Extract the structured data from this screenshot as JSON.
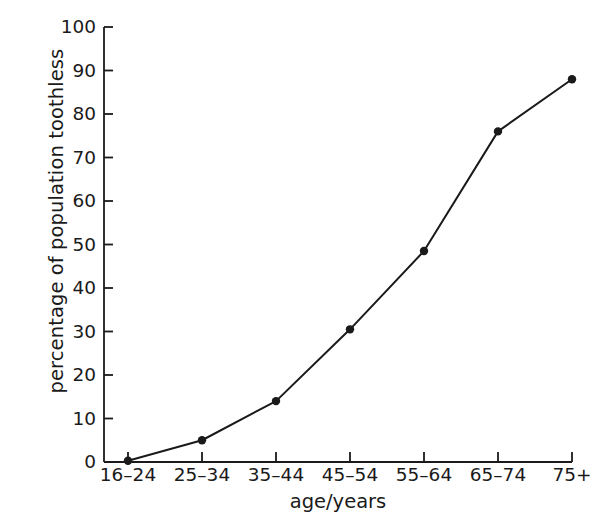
{
  "chart_data": {
    "type": "line",
    "title": "",
    "subtitle": "",
    "xlabel": "age/years",
    "ylabel": "percentage of population toothless",
    "categories": [
      "16–24",
      "25–34",
      "35–44",
      "45–54",
      "55–64",
      "65–74",
      "75+"
    ],
    "values": [
      0.3,
      5,
      14,
      30.5,
      48.5,
      76,
      88
    ],
    "series": [
      {
        "name": "percentage of population toothless",
        "values": [
          0.3,
          5,
          14,
          30.5,
          48.5,
          76,
          88
        ]
      }
    ],
    "ylim": [
      0,
      100
    ],
    "yticks": [
      0,
      10,
      20,
      30,
      40,
      50,
      60,
      70,
      80,
      90,
      100
    ],
    "ytick_labels": [
      "0",
      "10",
      "20",
      "30",
      "40",
      "50",
      "60",
      "70",
      "80",
      "90",
      "100"
    ],
    "xtick_labels": [
      "16–24",
      "25–34",
      "35–44",
      "45–54",
      "55–64",
      "65–74",
      "75+"
    ],
    "grid": false,
    "legend": false,
    "legend_position": "none",
    "marker": "filled-circle",
    "line_color": "#1a1a1a",
    "marker_color": "#1a1a1a",
    "background_color": "#ffffff",
    "annotations": []
  }
}
